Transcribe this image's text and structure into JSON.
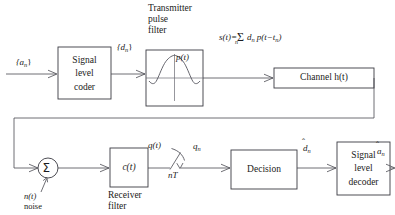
{
  "diagram": {
    "type": "signal-flow-block-diagram",
    "colors": {
      "background": "#ffffff",
      "wire": "#4a4a52",
      "box_border": "#3a3a42",
      "text": "#1b1b20"
    },
    "blocks": [
      {
        "id": "signal-level-coder",
        "label_lines": [
          "Signal",
          "level",
          "coder"
        ],
        "x": 58,
        "y": 47,
        "w": 53,
        "h": 52
      },
      {
        "id": "transmitter-pulse-filter",
        "label_lines": [],
        "x": 146,
        "y": 50,
        "w": 57,
        "h": 56,
        "inner_label": "p(t)"
      },
      {
        "id": "channel",
        "label": "Channel h(t)",
        "x": 274,
        "y": 68,
        "w": 100,
        "h": 20
      },
      {
        "id": "receiver-filter",
        "label": "c(t)",
        "x": 110,
        "y": 148,
        "w": 38,
        "h": 39
      },
      {
        "id": "decision",
        "label": "Decision",
        "x": 231,
        "y": 150,
        "w": 66,
        "h": 39
      },
      {
        "id": "signal-level-decoder",
        "label_lines": [
          "Signal",
          "level",
          "decoder"
        ],
        "x": 337,
        "y": 142,
        "w": 53,
        "h": 53
      }
    ],
    "captions": {
      "transmitter_pulse_filter": [
        "Transmitter",
        "pulse",
        "filter"
      ],
      "receiver_filter": [
        "Receiver",
        "filter"
      ],
      "noise": [
        "n(t)",
        "noise"
      ]
    },
    "equation": "s(t)=Σ d  p(t−t )",
    "equation_parts": {
      "lhs": "s(t)=",
      "sum": "Σ",
      "sum_index": "n",
      "d_symbol": "d",
      "d_sub": "n",
      "pulse": "p(t−t",
      "pulse_sub": "n",
      "close": ")"
    },
    "signals": [
      {
        "id": "input-an",
        "label": "{a",
        "sub": "n",
        "close": "}",
        "x": 16,
        "y": 57
      },
      {
        "id": "dn",
        "label": "{d",
        "sub": "n",
        "close": "}",
        "x": 117,
        "y": 42
      },
      {
        "id": "pt",
        "label": "p(t)",
        "x": 176,
        "y": 55
      },
      {
        "id": "qt",
        "label": "q(t)",
        "x": 148,
        "y": 142
      },
      {
        "id": "qn",
        "label": "q",
        "sub": "n",
        "x": 193,
        "y": 143
      },
      {
        "id": "nT",
        "label": "nT",
        "x": 170,
        "y": 167
      },
      {
        "id": "dn-hat",
        "label": "d",
        "sub": "n",
        "hat": true,
        "x": 302,
        "y": 143
      },
      {
        "id": "an-hat",
        "label": "a",
        "sub": "n",
        "hat": true,
        "x": 376,
        "y": 146
      }
    ],
    "summer": {
      "id": "summer",
      "glyph": "Σ",
      "cx": 48,
      "cy": 168,
      "r": 10
    },
    "sampler": {
      "id": "sampler-switch",
      "label": "nT",
      "x": 168,
      "y": 150
    }
  }
}
